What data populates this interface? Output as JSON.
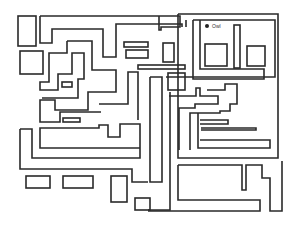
{
  "diagram": {
    "type": "maze",
    "stroke_color": "#2a2a2a",
    "background": "#ffffff",
    "goal": {
      "label": "Owl",
      "marker": "filled-circle"
    }
  }
}
